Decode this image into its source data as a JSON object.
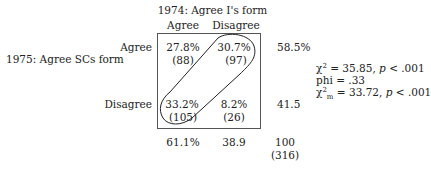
{
  "col_header": {
    "title": "1974: Agree I's form",
    "cols": [
      "Agree",
      "Disagree"
    ]
  },
  "row_header": {
    "title": "1975: Agree SCs form",
    "rows": [
      "Agree",
      "Disagree"
    ]
  },
  "cells": [
    [
      {
        "pct": "27.8%",
        "n": "(88)"
      },
      {
        "pct": "30.7%",
        "n": "(97)"
      }
    ],
    [
      {
        "pct": "33.2%",
        "n": "(105)"
      },
      {
        "pct": "8.2%",
        "n": "(26)"
      }
    ]
  ],
  "row_totals": [
    "58.5%",
    "41.5"
  ],
  "col_totals": [
    "61.1%",
    "38.9"
  ],
  "grand_total": {
    "pct": "100",
    "n": "(316)"
  },
  "stats": {
    "chi2_symbol": "χ",
    "chi2_sup": "2",
    "chi2_rest": " = 35.85, ",
    "p": "p",
    "p_rest": " < .001",
    "phi": "phi = .33",
    "chi2m_symbol": "χ",
    "chi2m_sup": "2",
    "chi2m_sub": "m",
    "chi2m_rest": " = 33.72, ",
    "p2": "p",
    "p2_rest": " < .001"
  },
  "highlight": "discordant-cells-loop"
}
